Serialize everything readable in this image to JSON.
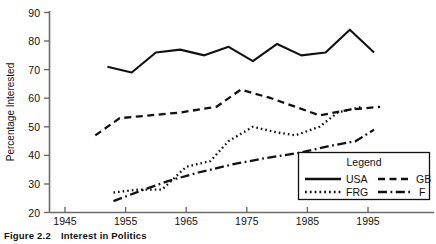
{
  "figure": {
    "caption_number": "Figure 2.2",
    "caption_title": "Interest in Politics"
  },
  "legend": {
    "title": "Legend",
    "entries": [
      {
        "label": "USA",
        "style": "solid"
      },
      {
        "label": "GB",
        "style": "dashed"
      },
      {
        "label": "FRG",
        "style": "dotted"
      },
      {
        "label": "F",
        "style": "dash-dot"
      }
    ]
  },
  "chart_data": {
    "type": "line",
    "title": "Interest in Politics",
    "xlabel": "",
    "ylabel": "Percentage Interested",
    "xlim": [
      1945,
      2000
    ],
    "ylim": [
      20,
      90
    ],
    "xticks": [
      1945,
      1955,
      1965,
      1975,
      1985,
      1995
    ],
    "yticks": [
      20,
      30,
      40,
      50,
      60,
      70,
      80,
      90
    ],
    "grid": false,
    "legend_position": "lower-right",
    "series": [
      {
        "name": "USA",
        "style": "solid",
        "x": [
          1952,
          1956,
          1960,
          1964,
          1968,
          1972,
          1976,
          1980,
          1984,
          1988,
          1992,
          1996
        ],
        "y": [
          71,
          69,
          76,
          77,
          75,
          78,
          73,
          79,
          75,
          76,
          84,
          76
        ]
      },
      {
        "name": "GB",
        "style": "dashed",
        "x": [
          1950,
          1954,
          1959,
          1964,
          1970,
          1974,
          1979,
          1983,
          1987,
          1992,
          1997
        ],
        "y": [
          47,
          53,
          54,
          55,
          57,
          63,
          60,
          57,
          54,
          56,
          57
        ]
      },
      {
        "name": "FRG",
        "style": "dotted",
        "x": [
          1953,
          1957,
          1961,
          1965,
          1969,
          1972,
          1976,
          1980,
          1983,
          1987,
          1990,
          1994
        ],
        "y": [
          27,
          28,
          28,
          36,
          38,
          45,
          50,
          48,
          47,
          50,
          55,
          57
        ]
      },
      {
        "name": "F",
        "style": "dash-dot",
        "x": [
          1953,
          1958,
          1962,
          1967,
          1973,
          1978,
          1984,
          1988,
          1993,
          1996
        ],
        "y": [
          24,
          28,
          31,
          34,
          37,
          39,
          41,
          43,
          45,
          49
        ]
      }
    ]
  },
  "axes": {
    "y_label": "Percentage Interested",
    "y_tick_labels": [
      "20",
      "30",
      "40",
      "50",
      "60",
      "70",
      "80",
      "90"
    ],
    "x_tick_labels": [
      "1945",
      "1955",
      "1965",
      "1975",
      "1985",
      "1995"
    ]
  },
  "colors": {
    "ink": "#111111",
    "axis": "#6b6b6b",
    "background": "#ffffff"
  }
}
